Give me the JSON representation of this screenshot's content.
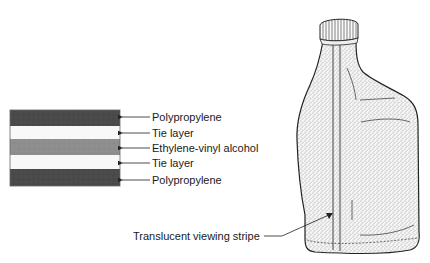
{
  "layers": {
    "items": [
      {
        "label": "Polypropylene",
        "color": "#4a4a4a"
      },
      {
        "label": "Tie layer",
        "color": "#f8f8f8"
      },
      {
        "label": "Ethylene-vinyl alcohol",
        "color": "#8e8e8e"
      },
      {
        "label": "Tie layer",
        "color": "#f8f8f8"
      },
      {
        "label": "Polypropylene",
        "color": "#4a4a4a"
      }
    ]
  },
  "bottle": {
    "callout_label": "Translucent viewing stripe"
  }
}
